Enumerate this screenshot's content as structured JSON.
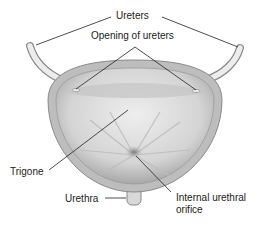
{
  "diagram": {
    "labels": {
      "ureters": "Ureters",
      "opening_of_ureters": "Opening of ureters",
      "trigone": "Trigone",
      "urethra": "Urethra",
      "internal_urethral_orifice_line1": "Internal urethral",
      "internal_urethral_orifice_line2": "orifice"
    },
    "colors": {
      "wall": "#b8b8b8",
      "interior": "#d9d9d9",
      "ureter": "#e8e8e8",
      "leader_line": "#222222"
    }
  }
}
